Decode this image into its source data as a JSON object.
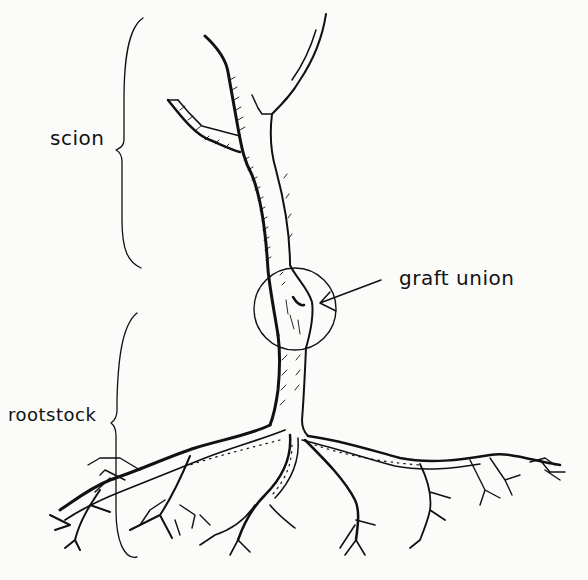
{
  "diagram": {
    "type": "labeled botanical illustration",
    "labels": {
      "scion": "scion",
      "graft_union": "graft union",
      "rootstock": "rootstock"
    },
    "parts": [
      {
        "id": "scion",
        "indicator": "curly brace",
        "region": "upper trunk and branches"
      },
      {
        "id": "graft_union",
        "indicator": "circle with arrow",
        "region": "junction of scion and rootstock"
      },
      {
        "id": "rootstock",
        "indicator": "curly brace",
        "region": "lower trunk and roots"
      }
    ],
    "colors": {
      "ink": "#111111",
      "paper": "#fbfbfa"
    }
  }
}
